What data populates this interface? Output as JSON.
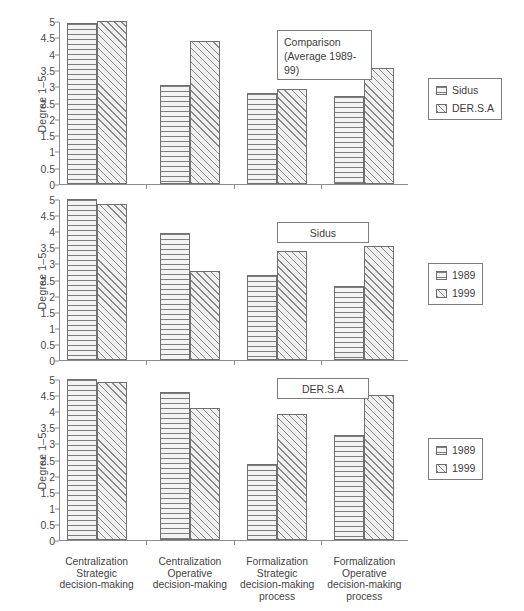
{
  "chart_data": [
    {
      "type": "bar",
      "panel_label": "Comparison\n(Average 1989-\n99)",
      "panel_label_lines": [
        "Comparison",
        "(Average 1989-",
        "99)"
      ],
      "title": "",
      "xlabel": "",
      "ylabel": "Degree 1–5",
      "ylim": [
        0,
        5
      ],
      "ytick_labels": [
        "0",
        "0.5",
        "1",
        "1.5",
        "2",
        "2.5",
        "3",
        "3.5",
        "4",
        "4.5",
        "5"
      ],
      "yticks": [
        0,
        0.5,
        1,
        1.5,
        2,
        2.5,
        3,
        3.5,
        4,
        4.5,
        5
      ],
      "grid": false,
      "legend_position": "right",
      "categories": [
        "Centralization Strategic decision-making",
        "Centralization Operative decision-making",
        "Formalization Strategic decision-making process",
        "Formalization Operative decision-making process"
      ],
      "series": [
        {
          "name": "Sidus",
          "pattern": "horizontal-hatch",
          "values": [
            4.95,
            3.05,
            2.8,
            2.7
          ]
        },
        {
          "name": "DER.S.A",
          "pattern": "diagonal-hatch",
          "values": [
            5.0,
            4.4,
            2.9,
            3.55
          ]
        }
      ]
    },
    {
      "type": "bar",
      "panel_label": "Sidus",
      "panel_label_lines": [
        "Sidus"
      ],
      "title": "",
      "xlabel": "",
      "ylabel": "Degree 1–5",
      "ylim": [
        0,
        5
      ],
      "ytick_labels": [
        "0",
        "0.5",
        "1",
        "1.5",
        "2",
        "2.5",
        "3",
        "3.5",
        "4",
        "4.5",
        "5"
      ],
      "yticks": [
        0,
        0.5,
        1,
        1.5,
        2,
        2.5,
        3,
        3.5,
        4,
        4.5,
        5
      ],
      "grid": false,
      "legend_position": "right",
      "categories": [
        "Centralization Strategic decision-making",
        "Centralization Operative decision-making",
        "Formalization Strategic decision-making process",
        "Formalization Operative decision-making process"
      ],
      "series": [
        {
          "name": "1989",
          "pattern": "horizontal-hatch",
          "values": [
            5.0,
            3.95,
            2.65,
            2.3
          ]
        },
        {
          "name": "1999",
          "pattern": "diagonal-hatch",
          "values": [
            4.85,
            2.75,
            3.4,
            3.55
          ]
        }
      ]
    },
    {
      "type": "bar",
      "panel_label": "DER.S.A",
      "panel_label_lines": [
        "DER.S.A"
      ],
      "title": "",
      "xlabel": "",
      "ylabel": "Degree 1–5",
      "ylim": [
        0,
        5
      ],
      "ytick_labels": [
        "0",
        "0.5",
        "1",
        "1.5",
        "2",
        "2.5",
        "3",
        "3.5",
        "4",
        "4.5",
        "5"
      ],
      "yticks": [
        0,
        0.5,
        1,
        1.5,
        2,
        2.5,
        3,
        3.5,
        4,
        4.5,
        5
      ],
      "grid": false,
      "legend_position": "right",
      "categories": [
        "Centralization Strategic decision-making",
        "Centralization Operative decision-making",
        "Formalization Strategic decision-making process",
        "Formalization Operative decision-making process"
      ],
      "series": [
        {
          "name": "1989",
          "pattern": "horizontal-hatch",
          "values": [
            5.0,
            4.6,
            2.35,
            3.25
          ]
        },
        {
          "name": "1999",
          "pattern": "diagonal-hatch",
          "values": [
            4.9,
            4.1,
            3.9,
            4.5
          ]
        }
      ]
    }
  ],
  "x_category_labels": [
    {
      "lines": [
        "Centralization",
        "Strategic",
        "decision-making"
      ]
    },
    {
      "lines": [
        "Centralization",
        "Operative",
        "decision-making"
      ]
    },
    {
      "lines": [
        "Formalization",
        "Strategic",
        "decision-making",
        "process"
      ]
    },
    {
      "lines": [
        "Formalization",
        "Operative",
        "decision-making",
        "process"
      ]
    }
  ],
  "colors": {
    "axis": "#8d8d8d",
    "bar_border": "#6f6f6f",
    "hatch_line": "#7e7e7e",
    "hatch_fill": "#f3f3f3",
    "text": "#3d3d3d",
    "box_border": "#7d7d7d"
  }
}
